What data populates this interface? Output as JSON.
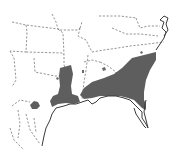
{
  "map": {
    "type": "species-range-map",
    "region": "Southeastern United States",
    "colors": {
      "background": "#ffffff",
      "range_fill": "#5e5e5e",
      "state_borders": "#7a7a7a",
      "coastline": "#3a3a3a"
    },
    "legend": [],
    "labels": []
  }
}
